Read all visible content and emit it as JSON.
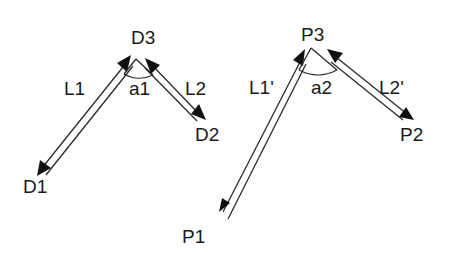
{
  "diagram": {
    "left_figure": {
      "apex_label": "D3",
      "end1_label": "D1",
      "end2_label": "D2",
      "segment1_label": "L1",
      "segment2_label": "L2",
      "angle_label": "a1"
    },
    "right_figure": {
      "apex_label": "P3",
      "end1_label": "P1",
      "end2_label": "P2",
      "segment1_label": "L1'",
      "segment2_label": "L2'",
      "angle_label": "a2"
    },
    "colors": {
      "line": "#2a2a2a",
      "arrowhead": "#111111",
      "text": "#1a1a1a",
      "background": "#ffffff"
    }
  }
}
